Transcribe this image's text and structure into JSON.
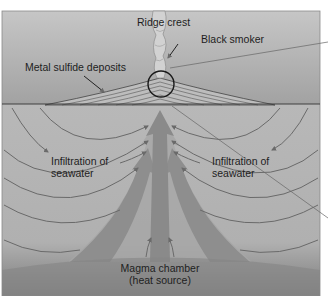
{
  "diagram": {
    "type": "cross-section",
    "colors": {
      "ocean_top": "#c4c4c4",
      "ocean_bottom": "#9c9c9c",
      "crust": "#b4b4b4",
      "magma": "#8a8a8a",
      "upflow": "#909090",
      "arrow_line": "#6a6a6a",
      "outline": "#2a2a2a"
    },
    "labels": {
      "ridge_crest": "Ridge crest",
      "black_smoker": "Black smoker",
      "metal_sulfide": "Metal sulfide deposits",
      "infiltration_left_1": "Infiltration of",
      "infiltration_left_2": "seawater",
      "infiltration_right_1": "Infiltration of",
      "infiltration_right_2": "seawater",
      "magma_1": "Magma chamber",
      "magma_2": "(heat source)"
    }
  }
}
